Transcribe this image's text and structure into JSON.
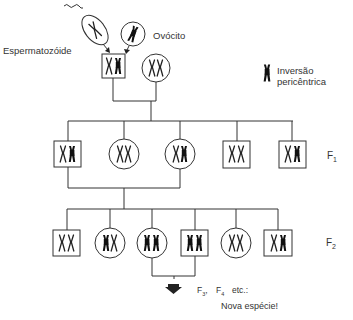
{
  "labels": {
    "sperm": "Espermatozóide",
    "oocyte": "Ovócito",
    "legend_line1": "Inversão",
    "legend_line2": "pericêntrica",
    "f1": "F",
    "f1_sub": "1",
    "f2": "F",
    "f2_sub": "2",
    "f3": "F",
    "f3_sub": "3",
    "f4": "F",
    "f4_sub": "4",
    "etc": "etc.:",
    "new_species": "Nova espécie!"
  },
  "colors": {
    "line": "#333333",
    "chromosome_normal": "#222222",
    "chromosome_inverted": "#111111",
    "background": "#ffffff"
  },
  "legend": {
    "icon": "inverted-chromosome-icon",
    "meaning": "Inversão pericêntrica"
  },
  "parents": [
    {
      "sex": "male",
      "shape": "square",
      "chromosomes": [
        "normal",
        "inverted"
      ]
    },
    {
      "sex": "female",
      "shape": "circle",
      "chromosomes": [
        "normal",
        "normal"
      ]
    }
  ],
  "gametes": [
    {
      "name": "Espermatozóide",
      "chromosome": "normal"
    },
    {
      "name": "Ovócito",
      "chromosome": "inverted"
    }
  ],
  "generations": {
    "F1": [
      {
        "sex": "male",
        "shape": "square",
        "chromosomes": [
          "normal",
          "inverted"
        ]
      },
      {
        "sex": "female",
        "shape": "circle",
        "chromosomes": [
          "normal",
          "normal"
        ]
      },
      {
        "sex": "female",
        "shape": "circle",
        "chromosomes": [
          "normal",
          "inverted"
        ]
      },
      {
        "sex": "male",
        "shape": "square",
        "chromosomes": [
          "normal",
          "normal"
        ]
      },
      {
        "sex": "male",
        "shape": "square",
        "chromosomes": [
          "normal",
          "inverted"
        ]
      }
    ],
    "F2": [
      {
        "sex": "male",
        "shape": "square",
        "chromosomes": [
          "normal",
          "normal"
        ]
      },
      {
        "sex": "female",
        "shape": "circle",
        "chromosomes": [
          "inverted",
          "normal"
        ]
      },
      {
        "sex": "female",
        "shape": "circle",
        "chromosomes": [
          "inverted",
          "inverted"
        ]
      },
      {
        "sex": "male",
        "shape": "square",
        "chromosomes": [
          "inverted",
          "inverted"
        ]
      },
      {
        "sex": "female",
        "shape": "circle",
        "chromosomes": [
          "normal",
          "normal"
        ]
      },
      {
        "sex": "male",
        "shape": "square",
        "chromosomes": [
          "normal",
          "inverted"
        ]
      }
    ]
  }
}
